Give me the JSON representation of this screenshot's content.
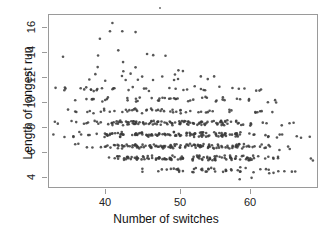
{
  "figure": {
    "background": "#ffffff",
    "point_color": "#3a3a3a",
    "axis_color": "#9a9a9a"
  },
  "axes": {
    "x": {
      "label": "Number of switches",
      "ticks": [
        40,
        50,
        60
      ],
      "tick_labels": [
        "40",
        "50",
        "60"
      ],
      "range": [
        33,
        70
      ]
    },
    "y": {
      "label": "Length of longest run",
      "ticks": [
        4,
        6,
        8,
        10,
        12,
        14,
        16
      ],
      "tick_labels": [
        "4",
        "6",
        "8",
        "10",
        "12",
        "14",
        "16"
      ],
      "range": [
        2.6,
        17.4
      ]
    }
  },
  "chart_data": {
    "type": "scatter",
    "title": "",
    "xlabel": "Number of switches",
    "ylabel": "Length of longest run",
    "xlim": [
      33,
      70
    ],
    "ylim": [
      2.6,
      17.4
    ],
    "grid": false,
    "legend": null,
    "marker": {
      "shape": "circle",
      "size": 1.3,
      "color": "#3a3a3a",
      "alpha": 0.85
    },
    "note": "Integer-valued jittered scatter; dense cloud with negative association between number of switches and length of longest run.",
    "points": [
      [
        35,
        11
      ],
      [
        36,
        13.7
      ],
      [
        38,
        11
      ],
      [
        40,
        11
      ],
      [
        41,
        16.7
      ],
      [
        41,
        15.9
      ],
      [
        40,
        15.2
      ],
      [
        42,
        15.9
      ],
      [
        40,
        14.0
      ],
      [
        43,
        14.2
      ],
      [
        46,
        15.8
      ],
      [
        46,
        14.0
      ],
      [
        47,
        13.9
      ],
      [
        48,
        13.9
      ],
      [
        44,
        13.2
      ],
      [
        41,
        12.8
      ],
      [
        43,
        12.6
      ],
      [
        46,
        12.8
      ],
      [
        50,
        12.6
      ],
      [
        52,
        12.7
      ],
      [
        40,
        12.2
      ],
      [
        43,
        12.1
      ],
      [
        45,
        12.2
      ],
      [
        47,
        12.1
      ],
      [
        49,
        12.2
      ],
      [
        51,
        12.1
      ],
      [
        53,
        12.2
      ],
      [
        55,
        12.1
      ],
      [
        39,
        11.9
      ],
      [
        42,
        11.8
      ],
      [
        44,
        11.9
      ],
      [
        46,
        11.8
      ],
      [
        48,
        11.9
      ],
      [
        50,
        11.8
      ],
      [
        52,
        11.9
      ],
      [
        54,
        11.8
      ],
      [
        36,
        11.1
      ],
      [
        38,
        11.0
      ],
      [
        41,
        11.1
      ],
      [
        43,
        11.0
      ],
      [
        45,
        11.1
      ],
      [
        47,
        11.0
      ],
      [
        49,
        11.1
      ],
      [
        51,
        11.0
      ],
      [
        53,
        11.1
      ],
      [
        55,
        11.0
      ],
      [
        57,
        11.1
      ],
      [
        59,
        11.0
      ],
      [
        62,
        11.0
      ],
      [
        38,
        10.2
      ],
      [
        40,
        10.1
      ],
      [
        42,
        10.2
      ],
      [
        44,
        10.1
      ],
      [
        45,
        10.2
      ],
      [
        47,
        10.1
      ],
      [
        48,
        10.2
      ],
      [
        50,
        10.1
      ],
      [
        51,
        10.2
      ],
      [
        53,
        10.1
      ],
      [
        55,
        10.2
      ],
      [
        56,
        10.1
      ],
      [
        58,
        10.2
      ],
      [
        60,
        10.0
      ],
      [
        63,
        10.0
      ],
      [
        37,
        9.2
      ],
      [
        39,
        9.1
      ],
      [
        41,
        9.2
      ],
      [
        42,
        9.1
      ],
      [
        44,
        9.2
      ],
      [
        45,
        9.1
      ],
      [
        46,
        9.2
      ],
      [
        47,
        9.1
      ],
      [
        48,
        9.2
      ],
      [
        49,
        9.1
      ],
      [
        50,
        9.2
      ],
      [
        51,
        9.1
      ],
      [
        52,
        9.2
      ],
      [
        54,
        9.1
      ],
      [
        56,
        9.2
      ],
      [
        58,
        9.1
      ],
      [
        61,
        9.1
      ],
      [
        63,
        9.0
      ],
      [
        35,
        8.2
      ],
      [
        37,
        8.1
      ],
      [
        39,
        8.2
      ],
      [
        41,
        8.1
      ],
      [
        42,
        8.2
      ],
      [
        43,
        8.1
      ],
      [
        44,
        8.2
      ],
      [
        45,
        8.1
      ],
      [
        46,
        8.2
      ],
      [
        47,
        8.1
      ],
      [
        48,
        8.2
      ],
      [
        49,
        8.1
      ],
      [
        50,
        8.2
      ],
      [
        51,
        8.1
      ],
      [
        52,
        8.2
      ],
      [
        53,
        8.1
      ],
      [
        54,
        8.2
      ],
      [
        55,
        8.1
      ],
      [
        56,
        8.2
      ],
      [
        57,
        8.1
      ],
      [
        58,
        8.2
      ],
      [
        60,
        8.1
      ],
      [
        62,
        8.0
      ],
      [
        66,
        8.0
      ],
      [
        34,
        7.2
      ],
      [
        36,
        7.1
      ],
      [
        38,
        7.2
      ],
      [
        40,
        7.1
      ],
      [
        41,
        7.2
      ],
      [
        42,
        7.1
      ],
      [
        43,
        7.2
      ],
      [
        44,
        7.1
      ],
      [
        45,
        7.2
      ],
      [
        46,
        7.1
      ],
      [
        47,
        7.2
      ],
      [
        48,
        7.1
      ],
      [
        49,
        7.2
      ],
      [
        50,
        7.1
      ],
      [
        51,
        7.2
      ],
      [
        52,
        7.1
      ],
      [
        53,
        7.2
      ],
      [
        54,
        7.1
      ],
      [
        55,
        7.2
      ],
      [
        56,
        7.1
      ],
      [
        57,
        7.2
      ],
      [
        58,
        7.1
      ],
      [
        59,
        7.2
      ],
      [
        60,
        7.1
      ],
      [
        62,
        7.0
      ],
      [
        64,
        7.0
      ],
      [
        68,
        6.9
      ],
      [
        38,
        6.2
      ],
      [
        40,
        6.1
      ],
      [
        42,
        6.2
      ],
      [
        43,
        6.1
      ],
      [
        44,
        6.2
      ],
      [
        45,
        6.1
      ],
      [
        46,
        6.2
      ],
      [
        47,
        6.1
      ],
      [
        48,
        6.2
      ],
      [
        49,
        6.1
      ],
      [
        50,
        6.2
      ],
      [
        51,
        6.1
      ],
      [
        52,
        6.2
      ],
      [
        53,
        6.1
      ],
      [
        54,
        6.2
      ],
      [
        55,
        6.1
      ],
      [
        56,
        6.2
      ],
      [
        57,
        6.1
      ],
      [
        58,
        6.2
      ],
      [
        59,
        6.1
      ],
      [
        60,
        6.2
      ],
      [
        61,
        6.1
      ],
      [
        62,
        6.2
      ],
      [
        63,
        6.1
      ],
      [
        65,
        6.0
      ],
      [
        42,
        5.2
      ],
      [
        44,
        5.1
      ],
      [
        45,
        5.2
      ],
      [
        46,
        5.1
      ],
      [
        47,
        5.2
      ],
      [
        48,
        5.1
      ],
      [
        49,
        5.2
      ],
      [
        50,
        5.1
      ],
      [
        51,
        5.2
      ],
      [
        52,
        5.1
      ],
      [
        53,
        5.2
      ],
      [
        54,
        5.1
      ],
      [
        55,
        5.2
      ],
      [
        56,
        5.1
      ],
      [
        57,
        5.2
      ],
      [
        58,
        5.1
      ],
      [
        59,
        5.2
      ],
      [
        60,
        5.1
      ],
      [
        61,
        5.2
      ],
      [
        62,
        5.1
      ],
      [
        63,
        5.2
      ],
      [
        65,
        5.1
      ],
      [
        69,
        5.0
      ],
      [
        47,
        4.1
      ],
      [
        49,
        4.2
      ],
      [
        50,
        4.1
      ],
      [
        51,
        4.2
      ],
      [
        52,
        4.1
      ],
      [
        53,
        4.2
      ],
      [
        54,
        4.1
      ],
      [
        55,
        4.2
      ],
      [
        56,
        4.1
      ],
      [
        57,
        4.2
      ],
      [
        58,
        4.1
      ],
      [
        59,
        4.2
      ],
      [
        60,
        4.1
      ],
      [
        62,
        4.1
      ],
      [
        64,
        4.0
      ],
      [
        66,
        4.0
      ],
      [
        61,
        3.4
      ],
      [
        58,
        3.3
      ]
    ]
  }
}
